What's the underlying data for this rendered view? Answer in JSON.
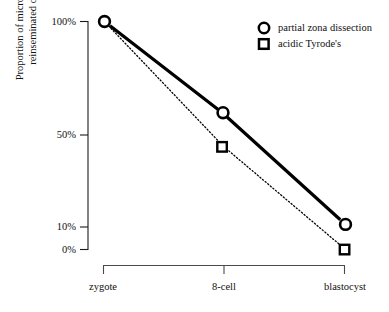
{
  "chart_data": {
    "type": "line",
    "title": "",
    "xlabel": "",
    "ylabel": "Proportion of microsurgically reinseminated oocytes",
    "categories": [
      "zygote",
      "8-cell",
      "blastocyst"
    ],
    "ytick_labels": [
      "100%",
      "50%",
      "10%",
      "0%"
    ],
    "ytick_values": [
      100,
      50,
      10,
      0
    ],
    "ylim": [
      0,
      100
    ],
    "grid": false,
    "legend_position": "top-right",
    "series": [
      {
        "name": "partial zona dissection",
        "marker": "circle",
        "line_style": "solid",
        "line_width": 3,
        "color": "#000000",
        "values": [
          100,
          60,
          11
        ]
      },
      {
        "name": "acidic Tyrode's",
        "marker": "square",
        "line_style": "dotted",
        "line_width": 1,
        "color": "#000000",
        "values": [
          100,
          45,
          0
        ]
      }
    ]
  },
  "axis": {
    "y_tick_100": "100%",
    "y_tick_50": "50%",
    "y_tick_10": "10%",
    "y_tick_0": "0%",
    "ylabel": "Proportion of microsurgically reinseminated oocytes",
    "cat_zygote": "zygote",
    "cat_8cell": "8-cell",
    "cat_blastocyst": "blastocyst"
  },
  "legend": {
    "entry_circle": "partial zona dissection",
    "entry_square": "acidic Tyrode's"
  }
}
